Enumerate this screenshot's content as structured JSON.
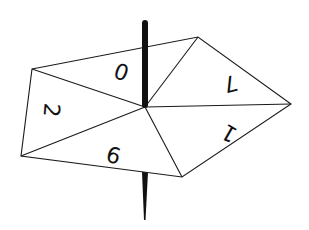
{
  "diagram": {
    "colors": {
      "line": "#1a1a1a",
      "fill": "#ffffff",
      "stick": "#111111"
    },
    "center": [
      145,
      107
    ],
    "vertices": [
      [
        32,
        69
      ],
      [
        198,
        37
      ],
      [
        291,
        104
      ],
      [
        182,
        177
      ],
      [
        21,
        156
      ]
    ],
    "sections": [
      {
        "label": "0",
        "x": 122,
        "y": 70,
        "rotate": 200
      },
      {
        "label": "7",
        "x": 230,
        "y": 82,
        "rotate": 165
      },
      {
        "label": "1",
        "x": 230,
        "y": 132,
        "rotate": 210
      },
      {
        "label": "6",
        "x": 113,
        "y": 157,
        "rotate": 15
      },
      {
        "label": "2",
        "x": 50,
        "y": 110,
        "rotate": 95
      }
    ]
  }
}
